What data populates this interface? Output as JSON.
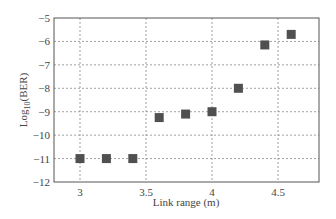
{
  "chart_data": {
    "type": "scatter",
    "title": "",
    "xlabel": "Link range (m)",
    "ylabel": "Log10(BER)",
    "xlim": [
      2.8,
      4.8
    ],
    "ylim": [
      -12,
      -5
    ],
    "xticks": [
      3,
      3.5,
      4,
      4.5
    ],
    "xtick_labels": [
      "3",
      "3.5",
      "4",
      "4.5"
    ],
    "yticks": [
      -5,
      -6,
      -7,
      -8,
      -9,
      -10,
      -11,
      -12
    ],
    "ytick_labels": [
      "-5",
      "-6",
      "-7",
      "-8",
      "-9",
      "-10",
      "-11",
      "-12"
    ],
    "grid": true,
    "legend": null,
    "series": [
      {
        "name": "BER",
        "marker": "square",
        "color": "#505050",
        "x": [
          3.0,
          3.2,
          3.4,
          3.6,
          3.8,
          4.0,
          4.2,
          4.4,
          4.6
        ],
        "y": [
          -11.0,
          -11.0,
          -11.0,
          -9.25,
          -9.1,
          -9.0,
          -8.0,
          -6.15,
          -5.7
        ]
      }
    ]
  }
}
